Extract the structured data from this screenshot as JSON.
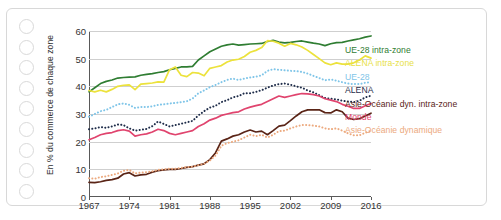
{
  "chart_data": {
    "type": "line",
    "title": "",
    "ylabel": "En % du commerce de chaque zone",
    "xlabel": "",
    "xlim": [
      1967,
      2016
    ],
    "ylim": [
      0,
      60
    ],
    "grid": true,
    "legend_position": "right",
    "yticks": [
      0,
      10,
      20,
      30,
      40,
      50,
      60
    ],
    "xticks": [
      1967,
      1974,
      1981,
      1988,
      1995,
      2002,
      2009,
      2016
    ],
    "x": [
      1967,
      1968,
      1969,
      1970,
      1971,
      1972,
      1973,
      1974,
      1975,
      1976,
      1977,
      1978,
      1979,
      1980,
      1981,
      1982,
      1983,
      1984,
      1985,
      1986,
      1987,
      1988,
      1989,
      1990,
      1991,
      1992,
      1993,
      1994,
      1995,
      1996,
      1997,
      1998,
      1999,
      2000,
      2001,
      2002,
      2003,
      2004,
      2005,
      2006,
      2007,
      2008,
      2009,
      2010,
      2011,
      2012,
      2013,
      2014,
      2015,
      2016
    ],
    "series": [
      {
        "name": "UE-28 intra-zone",
        "color": "#2f7d32",
        "style": "solid",
        "values": [
          38.0,
          39.5,
          41.0,
          41.8,
          42.3,
          43.0,
          43.2,
          43.3,
          43.4,
          44.0,
          44.3,
          44.6,
          45.0,
          45.3,
          46.0,
          46.5,
          47.0,
          47.0,
          47.2,
          49.5,
          51.0,
          52.5,
          53.5,
          54.5,
          55.0,
          55.3,
          54.9,
          55.1,
          55.3,
          55.4,
          55.5,
          56.2,
          56.6,
          56.0,
          55.7,
          55.9,
          56.2,
          56.4,
          56.0,
          55.6,
          55.3,
          54.7,
          55.4,
          55.8,
          55.9,
          56.4,
          56.8,
          57.2,
          57.8,
          58.2
        ]
      },
      {
        "name": "ALENA intra-zone",
        "color": "#ece23c",
        "style": "solid",
        "values": [
          38.5,
          38.0,
          38.6,
          38.0,
          38.9,
          40.0,
          40.4,
          40.5,
          38.8,
          40.8,
          41.0,
          41.2,
          41.6,
          41.5,
          46.0,
          47.0,
          44.0,
          43.5,
          45.0,
          44.8,
          43.8,
          46.5,
          47.0,
          47.5,
          48.8,
          49.5,
          49.8,
          50.8,
          52.3,
          53.0,
          54.0,
          56.5,
          56.3,
          55.6,
          54.5,
          55.5,
          55.0,
          54.2,
          53.0,
          51.5,
          50.0,
          48.5,
          47.8,
          48.5,
          48.0,
          48.0,
          48.5,
          49.5,
          51.0,
          50.2
        ]
      },
      {
        "name": "UE-28",
        "color": "#7fc5e8",
        "style": "dotted",
        "values": [
          29.0,
          30.0,
          31.0,
          31.5,
          32.5,
          33.5,
          33.8,
          33.3,
          32.2,
          32.5,
          32.5,
          32.8,
          33.3,
          33.5,
          33.8,
          34.0,
          34.3,
          34.6,
          35.6,
          37.5,
          38.5,
          39.7,
          40.5,
          41.5,
          42.3,
          42.8,
          42.3,
          42.8,
          43.2,
          43.5,
          44.0,
          45.6,
          46.2,
          46.0,
          45.8,
          45.6,
          45.5,
          45.2,
          44.6,
          43.8,
          43.0,
          42.2,
          42.5,
          42.0,
          41.5,
          41.0,
          40.8,
          40.8,
          41.3,
          41.5
        ]
      },
      {
        "name": "ALENA",
        "color": "#1f2d4a",
        "style": "dotted",
        "values": [
          24.5,
          24.8,
          25.3,
          25.0,
          25.5,
          26.2,
          26.0,
          24.8,
          24.0,
          24.3,
          24.6,
          25.6,
          27.3,
          26.4,
          25.5,
          26.0,
          26.5,
          27.0,
          27.5,
          29.5,
          31.0,
          32.3,
          33.0,
          34.3,
          35.0,
          36.0,
          36.5,
          37.5,
          37.5,
          38.0,
          38.6,
          39.5,
          40.3,
          40.8,
          41.0,
          40.6,
          40.0,
          39.5,
          38.5,
          37.8,
          36.8,
          35.8,
          35.5,
          35.3,
          34.8,
          34.5,
          34.3,
          34.8,
          36.0,
          36.6
        ]
      },
      {
        "name": "Asie-Océanie dyn. intra-zone",
        "color": "#5a2416",
        "style": "solid",
        "values": [
          5.3,
          5.2,
          5.5,
          6.0,
          6.3,
          6.8,
          8.3,
          8.8,
          7.6,
          8.0,
          8.2,
          9.0,
          9.5,
          9.8,
          10.0,
          10.0,
          10.3,
          10.7,
          11.0,
          11.5,
          12.0,
          13.5,
          16.0,
          20.2,
          21.0,
          22.0,
          22.5,
          23.5,
          24.2,
          23.5,
          23.8,
          22.5,
          24.0,
          25.6,
          26.0,
          27.6,
          29.3,
          30.8,
          31.5,
          31.5,
          31.5,
          30.5,
          30.4,
          31.5,
          30.8,
          28.5,
          28.0,
          28.3,
          29.3,
          30.3
        ]
      },
      {
        "name": "Monde",
        "color": "#e0446e",
        "style": "solid",
        "values": [
          20.7,
          21.5,
          22.5,
          23.0,
          23.3,
          24.0,
          24.3,
          23.8,
          22.0,
          22.5,
          22.8,
          23.5,
          24.5,
          24.0,
          23.0,
          22.5,
          23.0,
          23.5,
          24.0,
          25.5,
          26.5,
          27.8,
          28.5,
          29.5,
          30.0,
          30.5,
          30.8,
          31.8,
          32.5,
          33.0,
          33.5,
          34.5,
          35.5,
          36.5,
          36.0,
          36.5,
          37.0,
          37.4,
          37.3,
          37.0,
          36.5,
          35.5,
          35.0,
          34.5,
          33.5,
          32.8,
          32.0,
          32.0,
          33.0,
          33.8
        ]
      },
      {
        "name": "Asie-Océanie dynamique",
        "color": "#eca97e",
        "style": "dotted",
        "values": [
          6.8,
          6.6,
          7.2,
          7.5,
          8.0,
          8.5,
          9.5,
          9.8,
          8.5,
          8.8,
          9.0,
          9.3,
          9.8,
          10.0,
          10.2,
          10.2,
          10.5,
          10.8,
          11.0,
          11.5,
          12.0,
          13.2,
          15.0,
          18.5,
          19.5,
          20.0,
          20.5,
          21.5,
          22.5,
          22.0,
          22.5,
          21.5,
          22.5,
          23.8,
          24.0,
          24.8,
          25.5,
          26.0,
          26.0,
          25.8,
          25.5,
          24.8,
          24.5,
          24.8,
          24.0,
          23.0,
          22.3,
          22.3,
          23.2,
          24.0
        ]
      }
    ]
  },
  "legend": {
    "items": [
      {
        "label": "UE-28 intra-zone",
        "color": "#2f7d32"
      },
      {
        "label": "ALENA intra-zone",
        "color": "#e8df48"
      },
      {
        "label": "UE-28",
        "color": "#7fc5e8"
      },
      {
        "label": "ALENA",
        "color": "#1f2d4a"
      },
      {
        "label": "Asie-Océanie dyn. intra-zone",
        "color": "#5a2416"
      },
      {
        "label": "Monde",
        "color": "#e0446e"
      },
      {
        "label": "Asie-Océanie dynamique",
        "color": "#eca97e"
      }
    ]
  }
}
